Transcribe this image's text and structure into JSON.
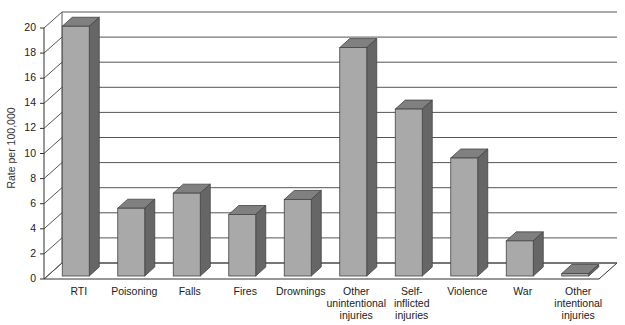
{
  "chart_data": {
    "type": "bar",
    "style": "3d-column",
    "title": "",
    "xlabel": "",
    "ylabel": "Rate per 100,000",
    "ylim": [
      0,
      20
    ],
    "yticks": [
      0,
      2,
      4,
      6,
      8,
      10,
      12,
      14,
      16,
      18,
      20
    ],
    "grid": true,
    "legend": null,
    "categories": [
      "RTI",
      "Poisoning",
      "Falls",
      "Fires",
      "Drownings",
      "Other unintentional injuries",
      "Self-inflicted injuries",
      "Violence",
      "War",
      "Other intentional injuries"
    ],
    "category_label_lines": [
      [
        "RTI"
      ],
      [
        "Poisoning"
      ],
      [
        "Falls"
      ],
      [
        "Fires"
      ],
      [
        "Drownings"
      ],
      [
        "Other",
        "unintentional",
        "injuries"
      ],
      [
        "Self-",
        "inflicted",
        "injuries"
      ],
      [
        "Violence"
      ],
      [
        "War"
      ],
      [
        "Other",
        "intentional",
        "injuries"
      ]
    ],
    "values": [
      19.9,
      5.4,
      6.6,
      4.9,
      6.1,
      18.2,
      13.3,
      9.4,
      2.8,
      0.2
    ],
    "colors": {
      "bar_front": "#a9a9a9",
      "bar_top": "#808080",
      "bar_side": "#666666",
      "grid": "#555555",
      "axis": "#333333"
    }
  }
}
